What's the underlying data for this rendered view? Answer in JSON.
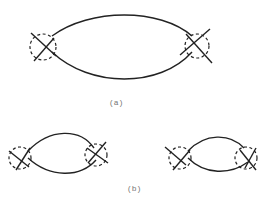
{
  "figure": {
    "labels": {
      "a": "(a)",
      "b": "(b)"
    },
    "panel_a": {
      "description": "Single loop (lens shape) with a crossed vertex enclosed by a dashed circle at each end"
    },
    "panel_b": {
      "description": "Two smaller loops, each with crossed vertices enclosed by dashed circles at both ends"
    },
    "colors": {
      "stroke": "#222222",
      "label": "#777777"
    }
  }
}
